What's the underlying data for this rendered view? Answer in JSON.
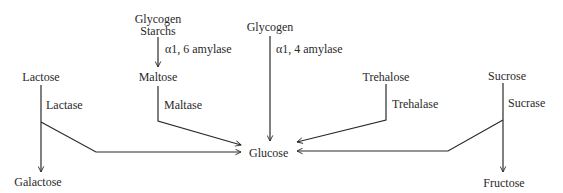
{
  "diagram": {
    "title": "",
    "line_color": "#2a2a2a",
    "nodes": {
      "glycogen_starchs_line1": "Glycogen",
      "glycogen_starchs_line2": "Starchs",
      "maltose": "Maltose",
      "glycogen": "Glycogen",
      "lactose": "Lactose",
      "galactose": "Galactose",
      "glucose": "Glucose",
      "trehalose": "Trehalose",
      "sucrose": "Sucrose",
      "fructose": "Fructose"
    },
    "enzymes": {
      "alpha16_amylase": "α1, 6 amylase",
      "alpha14_amylase": "α1, 4 amylase",
      "lactase": "Lactase",
      "maltase": "Maltase",
      "trehalase": "Trehalase",
      "sucrase": "Sucrase"
    },
    "edges": [
      {
        "from": "Glycogen/Starchs",
        "to": "Maltose",
        "enzyme": "α1, 6 amylase"
      },
      {
        "from": "Maltose",
        "to": "Glucose",
        "enzyme": "Maltase"
      },
      {
        "from": "Glycogen",
        "to": "Glucose",
        "enzyme": "α1, 4 amylase"
      },
      {
        "from": "Lactose",
        "to": "Glucose",
        "enzyme": "Lactase"
      },
      {
        "from": "Lactose",
        "to": "Galactose",
        "enzyme": "Lactase"
      },
      {
        "from": "Trehalose",
        "to": "Glucose",
        "enzyme": "Trehalase"
      },
      {
        "from": "Sucrose",
        "to": "Glucose",
        "enzyme": "Sucrase"
      },
      {
        "from": "Sucrose",
        "to": "Fructose",
        "enzyme": "Sucrase"
      }
    ]
  }
}
